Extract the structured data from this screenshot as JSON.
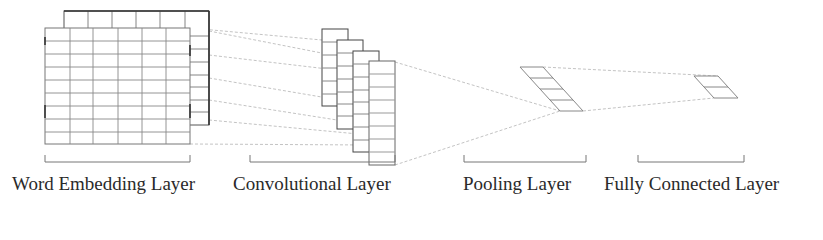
{
  "colors": {
    "stroke_dark": "#4a4a4a",
    "stroke_light": "#8a8a8a",
    "connector": "#b0b0b0",
    "text": "#2a2a2a"
  },
  "layers": [
    {
      "id": "embedding",
      "label": "Word Embedding Layer",
      "label_x": 12,
      "bracket": [
        45,
        190
      ]
    },
    {
      "id": "convolution",
      "label": "Convolutional Layer",
      "label_x": 233,
      "bracket": [
        250,
        395
      ]
    },
    {
      "id": "pooling",
      "label": "Pooling Layer",
      "label_x": 463,
      "bracket": [
        464,
        586
      ]
    },
    {
      "id": "fully_connected",
      "label": "Fully Connected Layer",
      "label_x": 604,
      "bracket": [
        638,
        744
      ]
    }
  ],
  "embedding": {
    "front": {
      "x": 45,
      "y": 28,
      "w": 145,
      "h": 116,
      "cols": 6,
      "rows": 9
    },
    "back": {
      "x": 64,
      "y": 11,
      "w": 145,
      "h": 114,
      "cols": 6,
      "rows": 9
    }
  },
  "convolution": {
    "maps": [
      {
        "x": 322,
        "y": 29,
        "w": 26,
        "h": 77,
        "rows": 6
      },
      {
        "x": 337,
        "y": 40,
        "w": 26,
        "h": 89,
        "rows": 7
      },
      {
        "x": 353,
        "y": 51,
        "w": 26,
        "h": 101,
        "rows": 8
      },
      {
        "x": 369,
        "y": 61,
        "w": 26,
        "h": 104,
        "rows": 8
      }
    ]
  },
  "pooling": {
    "top_left": [
      520,
      67
    ],
    "top_right": [
      543,
      67
    ],
    "bottom_left": [
      560,
      111
    ],
    "bottom_right": [
      583,
      111
    ],
    "rows": 4
  },
  "fully_connected": {
    "top_left": [
      694,
      76
    ],
    "top_right": [
      718,
      76
    ],
    "bottom_left": [
      714,
      98
    ],
    "bottom_right": [
      738,
      98
    ],
    "rows": 2
  }
}
